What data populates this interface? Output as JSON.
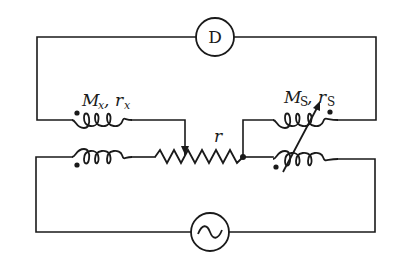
{
  "diagram": {
    "type": "AC mutual-inductance bridge circuit",
    "detector": {
      "label": "D"
    },
    "source": {
      "symbol": "~",
      "type": "AC source"
    },
    "unknown_inductor": {
      "label_main": "M",
      "label_sub": "x",
      "sep": ", ",
      "label_r": "r",
      "label_r_sub": "x"
    },
    "standard_inductor": {
      "label_main": "M",
      "label_sub": "S",
      "sep": ", ",
      "label_r": "r",
      "label_r_sub": "S",
      "variable": true
    },
    "slide_resistor": {
      "label": "r"
    }
  }
}
